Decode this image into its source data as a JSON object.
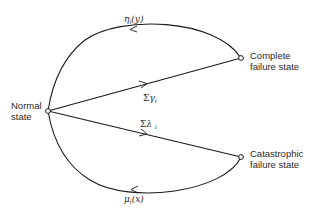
{
  "diagram": {
    "type": "state-transition",
    "nodes": [
      {
        "id": "normal",
        "label_line1": "Normal",
        "label_line2": "state",
        "x": 48,
        "y": 111
      },
      {
        "id": "complete",
        "label_line1": "Complete",
        "label_line2": "failure state",
        "x": 241,
        "y": 58
      },
      {
        "id": "catastrophic",
        "label_line1": "Catastrophic",
        "label_line2": "failure state",
        "x": 241,
        "y": 157
      }
    ],
    "edges": [
      {
        "id": "repair-complete",
        "from": "complete",
        "to": "normal",
        "shape": "arc-top",
        "label_symbol": "η",
        "label_sub": "i",
        "label_arg": "(y)"
      },
      {
        "id": "fail-complete",
        "from": "normal",
        "to": "complete",
        "shape": "straight",
        "label_symbol": "Σγ",
        "label_sub": "i",
        "label_arg": ""
      },
      {
        "id": "fail-catastrophic",
        "from": "normal",
        "to": "catastrophic",
        "shape": "straight",
        "label_symbol": "Σλ",
        "label_sub": "i",
        "label_arg": ""
      },
      {
        "id": "repair-catastrophic",
        "from": "catastrophic",
        "to": "normal",
        "shape": "arc-bottom",
        "label_symbol": "μ",
        "label_sub": "i",
        "label_arg": "(x)"
      }
    ],
    "colors": {
      "line": "#1a1a1a",
      "node_fill": "#ffffff",
      "text": "#2a2a2a",
      "background": "#ffffff"
    }
  },
  "labels": {
    "normal": {
      "line1": "Normal",
      "line2": "state"
    },
    "complete": {
      "line1": "Complete",
      "line2": "failure state"
    },
    "catastrophic": {
      "line1": "Catastrophic",
      "line2": "failure state"
    },
    "eta": {
      "symbol": "η",
      "sub": "i",
      "arg": "(y)"
    },
    "gamma": {
      "sigma": "Σ",
      "symbol": "γ",
      "sub": "i"
    },
    "lambda": {
      "sigma": "Σ",
      "symbol": "λ",
      "sub": "i"
    },
    "mu": {
      "symbol": "μ",
      "sub": "i",
      "arg": "(x)"
    }
  }
}
